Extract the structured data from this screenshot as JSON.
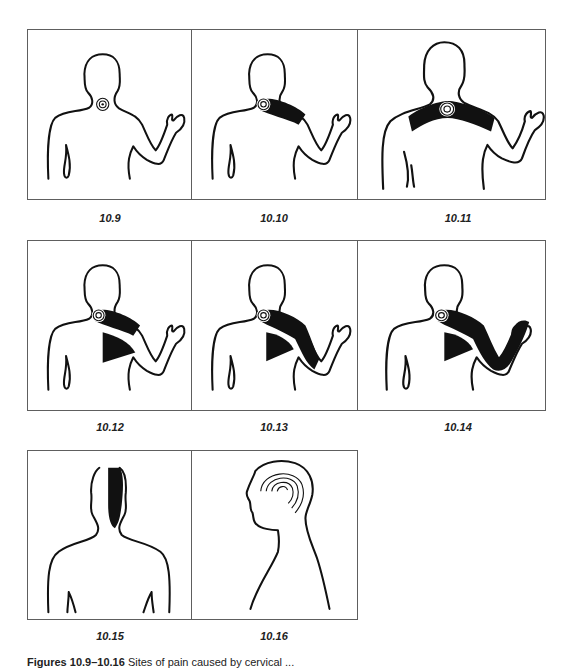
{
  "figures": [
    {
      "id": "10.9",
      "label": "10.9",
      "view": "back",
      "pain_region": "base of neck (point)"
    },
    {
      "id": "10.10",
      "label": "10.10",
      "view": "back",
      "pain_region": "neck to upper shoulder"
    },
    {
      "id": "10.11",
      "label": "10.11",
      "view": "back",
      "pain_region": "across both shoulders"
    },
    {
      "id": "10.12",
      "label": "10.12",
      "view": "back",
      "pain_region": "neck, shoulder and scapula"
    },
    {
      "id": "10.13",
      "label": "10.13",
      "view": "back",
      "pain_region": "neck, shoulder, scapula and upper arm"
    },
    {
      "id": "10.14",
      "label": "10.14",
      "view": "back",
      "pain_region": "neck, shoulder, scapula, whole arm to hand"
    },
    {
      "id": "10.15",
      "label": "10.15",
      "view": "back",
      "pain_region": "back of head and neck"
    },
    {
      "id": "10.16",
      "label": "10.16",
      "view": "side profile",
      "pain_region": "over top of head"
    }
  ],
  "caption": {
    "prefix": "Figures 10.9–10.16",
    "text": "Sites of pain caused by cervical ..."
  },
  "colors": {
    "line": "#111111",
    "frame": "#5e5e5e",
    "background": "#ffffff"
  }
}
